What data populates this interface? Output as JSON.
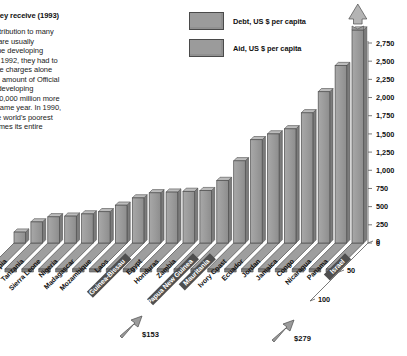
{
  "article": {
    "title": "nd the aid they receive (1993)",
    "body_lines": [
      "ke a vital contribution to many",
      "untries, they are usually",
      "of debt that the developing",
      "d to repay. In 1992, they had to",
      "in debt service charges alone",
      "half times the amount of Official",
      "e (ODA) the developing",
      "g, and US $60,000 million more",
      "of aid in the same year. In 1990,",
      "ue, one of the world's poorest",
      "ed to be 75 times its entire"
    ]
  },
  "legend": {
    "items": [
      {
        "label": "Debt, US $  per capita",
        "color": "#9b9b9b"
      },
      {
        "label": "Aid, US $ per capita",
        "color": "#9b9b9b"
      }
    ]
  },
  "annotations": {
    "aid_low": "$153",
    "aid_high": "$279"
  },
  "chart_data": {
    "type": "bar",
    "title": "nd the aid they receive (1993)",
    "xlabel": "",
    "ylabel": "Debt, US $ per capita",
    "ylim": [
      0,
      2750
    ],
    "yticks": [
      "0",
      "250",
      "500",
      "750",
      "1,000",
      "1,250",
      "1,500",
      "1,750",
      "2,000",
      "2,250",
      "2,500",
      "2,750"
    ],
    "ytick_values": [
      0,
      250,
      500,
      750,
      1000,
      1250,
      1500,
      1750,
      2000,
      2250,
      2500,
      2750
    ],
    "depth_axis_ticks": [
      "0",
      "50",
      "100"
    ],
    "grid": false,
    "legend_position": "top-center",
    "categories": [
      "Ethiopia",
      "Tanzania",
      "Sierra Leone",
      "Nigeria",
      "Madagascar",
      "Mozambique",
      "Laos",
      "Guinea-Bissau",
      "Egypt",
      "Honduras",
      "Zambia",
      "Papua New Guinea",
      "Mauritania",
      "Ivory Coast",
      "Ecuador",
      "Jordan",
      "Jamaica",
      "Congo",
      "Nicaragua",
      "Panama",
      "Israel"
    ],
    "highlighted_categories": [
      "Guinea-Bissau",
      "Papua New Guinea",
      "Mauritania",
      "Israel"
    ],
    "series": [
      {
        "name": "Debt, US $ per capita",
        "values": [
          150,
          290,
          360,
          370,
          400,
          430,
          520,
          620,
          690,
          700,
          710,
          720,
          860,
          1130,
          1420,
          1500,
          1570,
          1790,
          2080,
          2440,
          3050
        ],
        "color": "#9b9b9b"
      }
    ],
    "last_bar_clipped": true,
    "last_bar_note": "Israel bar exceeds axis maximum; drawn broken with arrow cap"
  }
}
